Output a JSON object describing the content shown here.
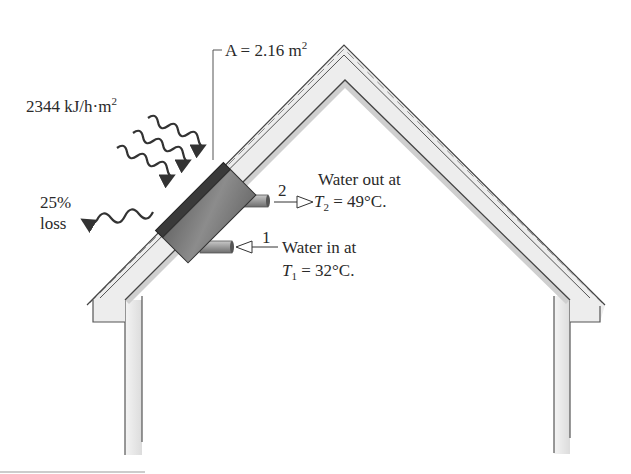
{
  "diagram": {
    "type": "solar-collector-on-roof",
    "labels": {
      "area": "A = 2.16 m",
      "area_sup": "2",
      "irradiance": "2344 kJ/h·m",
      "irradiance_sup": "2",
      "loss_pct": "25%",
      "loss_word": "loss",
      "out_state": "2",
      "out_line1": "Water out at",
      "out_T": "T",
      "out_T_sub": "2",
      "out_T_value": " = 49°C.",
      "in_state": "1",
      "in_line1": "Water in at",
      "in_T": "T",
      "in_T_sub": "1",
      "in_T_value": " = 32°C."
    },
    "values": {
      "collector_area_m2": 2.16,
      "solar_flux_kJ_per_h_m2": 2344,
      "loss_percent": 25,
      "T_in_C": 32,
      "T_out_C": 49
    },
    "colors": {
      "ink": "#2a2a2a",
      "panel_dark": "#3c3c3c",
      "panel_body": "#7a7a7a",
      "roof_fill": "#ececec",
      "wall_fill": "#eeeeee",
      "pipe": "#8a8a8a"
    }
  }
}
